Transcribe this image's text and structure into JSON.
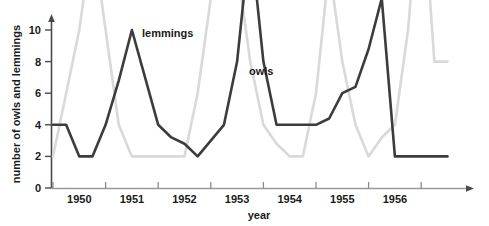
{
  "chart_data": {
    "type": "line",
    "title": "",
    "xlabel": "year",
    "ylabel": "number of owls and lemmings",
    "ylim": [
      0,
      11
    ],
    "yticks": [
      0,
      2,
      4,
      6,
      8,
      10
    ],
    "ytick_labels": [
      "0",
      "2",
      "4",
      "6",
      "8",
      "10"
    ],
    "xtick_labels": [
      "1950",
      "1951",
      "1952",
      "1953",
      "1954",
      "1955",
      "1956"
    ],
    "grid": false,
    "legend": "inline-annotation",
    "annotations": [
      {
        "text": "lemmings",
        "x": 1951.35,
        "y": 10.4
      },
      {
        "text": "owls",
        "x": 1953.35,
        "y": 7.5
      }
    ],
    "x": [
      1949.5,
      1949.75,
      1950.0,
      1950.25,
      1950.5,
      1950.75,
      1951.0,
      1951.25,
      1951.5,
      1951.75,
      1952.0,
      1952.25,
      1952.5,
      1952.75,
      1953.0,
      1953.25,
      1953.5,
      1953.75,
      1954.0,
      1954.25,
      1954.5,
      1954.75,
      1955.0,
      1955.25,
      1955.5,
      1955.75,
      1956.0,
      1956.25,
      1956.5,
      1956.75,
      1957.0
    ],
    "series": [
      {
        "name": "owls",
        "color": "#3c3c3c",
        "values": [
          2,
          2,
          1,
          1,
          2,
          3.4,
          5,
          3.5,
          2,
          1.6,
          1.4,
          1,
          1.5,
          2,
          4,
          8,
          4,
          2,
          2,
          2,
          2,
          2.2,
          3,
          3.2,
          4.4,
          6,
          1,
          1,
          1,
          1,
          1
        ]
      },
      {
        "name": "lemmings",
        "color": "#d9d9d9",
        "values": [
          1,
          3,
          5,
          8,
          5,
          2,
          1,
          1,
          1,
          1,
          1,
          3,
          6,
          10,
          7,
          4,
          2,
          1.4,
          1,
          1,
          3,
          7,
          4,
          2,
          1,
          1.6,
          2,
          5,
          10,
          4,
          4
        ]
      }
    ]
  },
  "axes": {
    "y_axis_name": "y-axis",
    "x_axis_name": "x-axis"
  }
}
